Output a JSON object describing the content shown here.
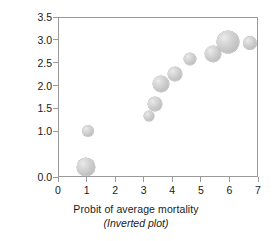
{
  "chart_data": {
    "type": "scatter",
    "title": "",
    "xlabel": "Probit of average mortality",
    "xsublabel": "(Inverted plot)",
    "ylabel": "Log concentration",
    "xlim": [
      0,
      7
    ],
    "ylim": [
      0.0,
      3.5
    ],
    "grid": false,
    "legend": null,
    "xticks": [
      "0",
      "1",
      "2",
      "3",
      "4",
      "5",
      "6",
      "7"
    ],
    "xtick_values": [
      0,
      1,
      2,
      3,
      4,
      5,
      6,
      7
    ],
    "yticks": [
      "0.0",
      "1.0",
      "1.5",
      "2.0",
      "2.5",
      "3.0",
      "3.5"
    ],
    "ytick_values": [
      0.0,
      1.0,
      1.5,
      2.0,
      2.5,
      3.0,
      3.5
    ],
    "marker_color": "#c9c9c9",
    "marker_edge_color": "#a8a8a8",
    "axis_color": "#9a9a9a",
    "points": [
      {
        "x": 1.0,
        "y": 1.02,
        "size": 11
      },
      {
        "x": 0.96,
        "y": 0.25,
        "size": 18
      },
      {
        "x": 3.14,
        "y": 1.35,
        "size": 10
      },
      {
        "x": 3.35,
        "y": 1.62,
        "size": 14
      },
      {
        "x": 3.56,
        "y": 2.05,
        "size": 16
      },
      {
        "x": 4.06,
        "y": 2.28,
        "size": 14
      },
      {
        "x": 4.6,
        "y": 2.6,
        "size": 12
      },
      {
        "x": 5.4,
        "y": 2.72,
        "size": 16
      },
      {
        "x": 5.92,
        "y": 2.97,
        "size": 22
      },
      {
        "x": 6.68,
        "y": 2.95,
        "size": 13
      }
    ]
  }
}
